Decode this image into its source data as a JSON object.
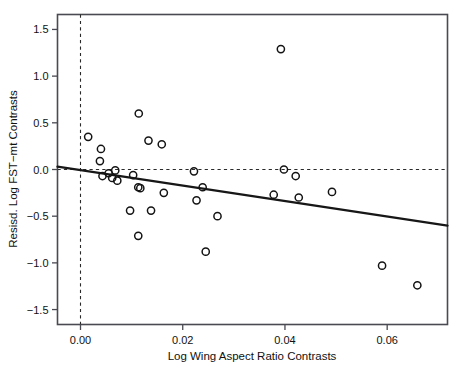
{
  "chart_data": {
    "type": "scatter",
    "title": "",
    "xlabel": "Log Wing Aspect Ratio Contrasts",
    "ylabel": "Resisd. Log FST−mt Contrasts",
    "xlim": [
      -0.0045,
      0.0718
    ],
    "ylim": [
      -1.66,
      1.66
    ],
    "xticks": [
      0.0,
      0.02,
      0.04,
      0.06
    ],
    "xticklabels": [
      "0.00",
      "0.02",
      "0.04",
      "0.06"
    ],
    "yticks": [
      1.5,
      1.0,
      0.5,
      0.0,
      -0.5,
      -1.0,
      -1.5
    ],
    "yticklabels": [
      "1.5",
      "1.0",
      "0.5",
      "0.0",
      "-0.5",
      "-1.0",
      "-1.5"
    ],
    "grid": false,
    "legend": null,
    "marker": "open-circle",
    "points": [
      {
        "x": 0.0015,
        "y": 0.35
      },
      {
        "x": 0.004,
        "y": 0.22
      },
      {
        "x": 0.0038,
        "y": 0.09
      },
      {
        "x": 0.0043,
        "y": -0.07
      },
      {
        "x": 0.0055,
        "y": -0.04
      },
      {
        "x": 0.0062,
        "y": -0.09
      },
      {
        "x": 0.0068,
        "y": -0.01
      },
      {
        "x": 0.0072,
        "y": -0.12
      },
      {
        "x": 0.0097,
        "y": -0.44
      },
      {
        "x": 0.0103,
        "y": -0.06
      },
      {
        "x": 0.0114,
        "y": 0.6
      },
      {
        "x": 0.0113,
        "y": -0.19
      },
      {
        "x": 0.0117,
        "y": -0.2
      },
      {
        "x": 0.0113,
        "y": -0.71
      },
      {
        "x": 0.0133,
        "y": 0.31
      },
      {
        "x": 0.0138,
        "y": -0.44
      },
      {
        "x": 0.0159,
        "y": 0.27
      },
      {
        "x": 0.0163,
        "y": -0.25
      },
      {
        "x": 0.0222,
        "y": -0.02
      },
      {
        "x": 0.0227,
        "y": -0.33
      },
      {
        "x": 0.0239,
        "y": -0.19
      },
      {
        "x": 0.0245,
        "y": -0.88
      },
      {
        "x": 0.0268,
        "y": -0.5
      },
      {
        "x": 0.0378,
        "y": -0.27
      },
      {
        "x": 0.0392,
        "y": 1.29
      },
      {
        "x": 0.0398,
        "y": 0.0
      },
      {
        "x": 0.0421,
        "y": -0.07
      },
      {
        "x": 0.0427,
        "y": -0.3
      },
      {
        "x": 0.0492,
        "y": -0.24
      },
      {
        "x": 0.059,
        "y": -1.03
      },
      {
        "x": 0.0659,
        "y": -1.24
      }
    ],
    "reference_line": {
      "orientation": "horizontal",
      "y": 0.0,
      "style": "dashed"
    },
    "reference_line_vertical": {
      "orientation": "vertical",
      "x": 0.0,
      "style": "dashed"
    },
    "fit_line": {
      "style": "solid",
      "x_start": -0.0045,
      "y_start": 0.03,
      "x_end": 0.0718,
      "y_end": -0.6
    }
  }
}
